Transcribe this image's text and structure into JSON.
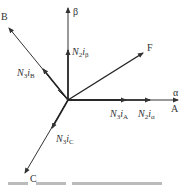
{
  "diagram": {
    "axes": {
      "alpha": "α",
      "beta": "β"
    },
    "phases": {
      "A": "A",
      "B": "B",
      "C": "C",
      "F": "F"
    },
    "vectors": {
      "n2_i_beta": {
        "coef": "N",
        "sub": "2",
        "var": "i",
        "var_sub": "β"
      },
      "n3_i_b": {
        "coef": "N",
        "sub": "3",
        "var": "i",
        "var_sub": "B"
      },
      "n3_i_a": {
        "coef": "N",
        "sub": "3",
        "var": "i",
        "var_sub": "A"
      },
      "n2_i_alpha": {
        "coef": "N",
        "sub": "2",
        "var": "i",
        "var_sub": "α"
      },
      "n3_i_c": {
        "coef": "N",
        "sub": "3",
        "var": "i",
        "var_sub": "C"
      }
    }
  }
}
